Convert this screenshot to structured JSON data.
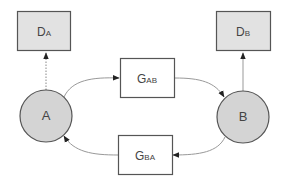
{
  "diagram": {
    "colors": {
      "node_fill": "#d4d4d4",
      "data_box_fill": "#e2e2e2",
      "generator_fill": "#ffffff",
      "stroke": "#555555",
      "edge": "#888888",
      "text": "#444444"
    },
    "nodes": {
      "A": {
        "label": "A"
      },
      "B": {
        "label": "B"
      }
    },
    "data_boxes": {
      "DA": {
        "main": "D",
        "sub": "A"
      },
      "DB": {
        "main": "D",
        "sub": "B"
      }
    },
    "generators": {
      "GAB": {
        "main": "G",
        "sub": "AB"
      },
      "GBA": {
        "main": "G",
        "sub": "BA"
      }
    },
    "edges": [
      {
        "from": "A",
        "to": "DA",
        "style": "dotted"
      },
      {
        "from": "B",
        "to": "DB",
        "style": "solid"
      },
      {
        "from": "A",
        "to": "GAB",
        "style": "solid"
      },
      {
        "from": "GAB",
        "to": "B",
        "style": "solid"
      },
      {
        "from": "B",
        "to": "GBA",
        "style": "solid"
      },
      {
        "from": "GBA",
        "to": "A",
        "style": "solid"
      }
    ]
  }
}
